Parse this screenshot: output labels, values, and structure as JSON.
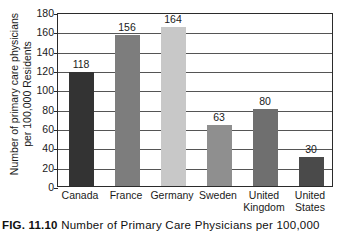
{
  "figure": {
    "caption_number": "FIG. 11.10",
    "caption_text": "Number of Primary Care Physicians per 100,000"
  },
  "chart_data": {
    "type": "bar",
    "title": "",
    "xlabel": "",
    "ylabel": "Number of primary care physicians per 100,000 Residents",
    "ylabel_line1": "Number of primary care physicians",
    "ylabel_line2": "per 100,000 Residents",
    "categories": [
      "Canada",
      "France",
      "Germany",
      "Sweden",
      "United Kingdom",
      "United States"
    ],
    "category_lines": [
      [
        "Canada"
      ],
      [
        "France"
      ],
      [
        "Germany"
      ],
      [
        "Sweden"
      ],
      [
        "United",
        "Kingdom"
      ],
      [
        "United",
        "States"
      ]
    ],
    "values": [
      118,
      156,
      164,
      63,
      80,
      30
    ],
    "value_labels": [
      "118",
      "156",
      "164",
      "63",
      "80",
      "30"
    ],
    "bar_colors": [
      "#333333",
      "#7d7d7d",
      "#c8c8c8",
      "#8f8f8f",
      "#6f6f6f",
      "#4a4a4a"
    ],
    "ylim": [
      0,
      180
    ],
    "yticks": [
      0,
      20,
      40,
      60,
      80,
      100,
      120,
      140,
      160,
      180
    ],
    "ytick_labels": [
      "0",
      "20",
      "40",
      "60",
      "80",
      "100",
      "120",
      "140",
      "160",
      "180"
    ],
    "grid": true,
    "grid_axis": "y",
    "legend": false,
    "legend_position": "none",
    "axis_color": "#2b2b2b",
    "grid_color": "#555555",
    "background": "#ffffff"
  }
}
